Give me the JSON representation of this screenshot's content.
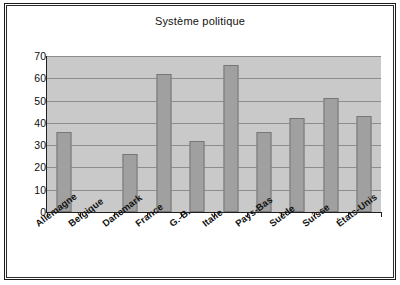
{
  "chart_data": {
    "type": "bar",
    "title": "Système politique",
    "xlabel": "",
    "ylabel": "",
    "categories": [
      "Allemagne",
      "Belgique",
      "Danemark",
      "France",
      "G.-B.",
      "Italie",
      "Pays-Bas",
      "Suède",
      "Suisse",
      "États-Unis"
    ],
    "values": [
      36,
      null,
      26,
      62,
      32,
      66,
      36,
      42,
      51,
      43
    ],
    "ylim": [
      0,
      70
    ],
    "yticks": [
      0,
      10,
      20,
      30,
      40,
      50,
      60,
      70
    ],
    "ytick_labels": [
      "0",
      "10",
      "20",
      "30",
      "40",
      "50",
      "60",
      "70"
    ],
    "grid": true,
    "legend": "none",
    "series": [
      {
        "name": "Système politique",
        "values": [
          36,
          null,
          26,
          62,
          32,
          66,
          36,
          42,
          51,
          43
        ]
      }
    ],
    "colors": {
      "bar_fill": "#a0a0a0",
      "bar_border": "#767676",
      "plot_background": "#c9c9c9",
      "gridline": "#8d8d8d",
      "axis": "#1f1f1f",
      "frame_border": "#1a1a1a",
      "page_background": "#ffffff",
      "text": "#111111"
    }
  }
}
